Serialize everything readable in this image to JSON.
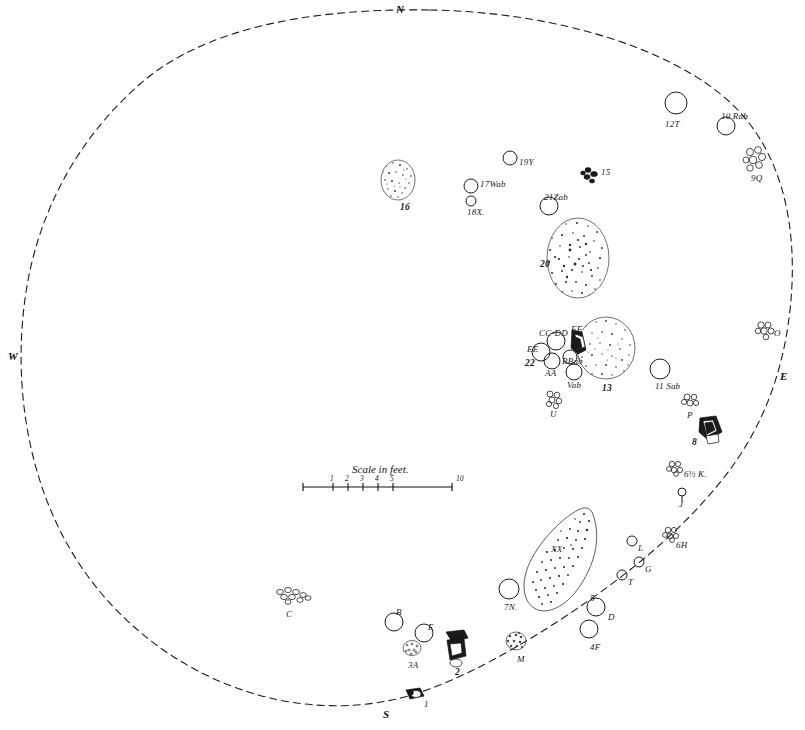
{
  "map": {
    "title": "Archaeological site plan",
    "boundary_style": "dashed",
    "ink_color": "#1a1a1a",
    "paper_color": "#ffffff"
  },
  "compass": {
    "north": "N",
    "south": "S",
    "east": "E",
    "west": "W"
  },
  "scale": {
    "caption": "Scale in feet.",
    "ticks": [
      "1",
      "2",
      "3",
      "4",
      "5",
      "10"
    ]
  },
  "features": [
    {
      "id": "f16",
      "label": "16",
      "x": 398,
      "y": 180,
      "kind": "stipple-blob",
      "w": 34,
      "h": 40,
      "lx": 400,
      "ly": 203,
      "bold": true
    },
    {
      "id": "f19y",
      "label": "19Y",
      "x": 510,
      "y": 158,
      "kind": "circle",
      "r": 7,
      "lx": 519,
      "ly": 158,
      "bold": false
    },
    {
      "id": "f17",
      "label": "17Wab",
      "x": 471,
      "y": 186,
      "kind": "circle",
      "r": 7,
      "lx": 480,
      "ly": 180,
      "bold": false
    },
    {
      "id": "f18x",
      "label": "18X.",
      "x": 471,
      "y": 201,
      "kind": "circle",
      "r": 5,
      "lx": 467,
      "ly": 208,
      "bold": false
    },
    {
      "id": "f15",
      "label": "15",
      "x": 592,
      "y": 173,
      "kind": "cobble-dark",
      "w": 16,
      "h": 14,
      "lx": 601,
      "ly": 168,
      "bold": false
    },
    {
      "id": "f21",
      "label": "21Zab",
      "x": 549,
      "y": 206,
      "kind": "circle",
      "r": 9,
      "lx": 544,
      "ly": 193,
      "bold": false
    },
    {
      "id": "f20",
      "label": "20",
      "x": 578,
      "y": 258,
      "kind": "stipple-blob",
      "w": 62,
      "h": 80,
      "lx": 540,
      "ly": 260,
      "bold": true
    },
    {
      "id": "f12t",
      "label": "12T",
      "x": 676,
      "y": 103,
      "kind": "circle",
      "r": 11,
      "lx": 665,
      "ly": 120,
      "bold": false
    },
    {
      "id": "f10",
      "label": "10 Rab",
      "x": 726,
      "y": 126,
      "kind": "circle",
      "r": 9,
      "lx": 721,
      "ly": 112,
      "bold": false
    },
    {
      "id": "f9q",
      "label": "9Q",
      "x": 755,
      "y": 158,
      "kind": "cobble-cluster",
      "w": 20,
      "h": 20,
      "lx": 751,
      "ly": 174,
      "bold": false
    },
    {
      "id": "fO",
      "label": "O",
      "x": 765,
      "y": 329,
      "kind": "cobble-cluster",
      "w": 16,
      "h": 15,
      "lx": 774,
      "ly": 329,
      "bold": false
    },
    {
      "id": "fccdd",
      "label": "CC-DD",
      "x": 556,
      "y": 341,
      "kind": "circle",
      "r": 9,
      "lx": 539,
      "ly": 329,
      "bold": false
    },
    {
      "id": "fee",
      "label": "EE",
      "x": 541,
      "y": 352,
      "kind": "circle",
      "r": 9,
      "lx": 527,
      "ly": 345,
      "bold": false
    },
    {
      "id": "f22",
      "label": "22",
      "x": 541,
      "y": 352,
      "kind": "none",
      "r": 0,
      "lx": 525,
      "ly": 359,
      "bold": true
    },
    {
      "id": "faa",
      "label": "AA",
      "x": 552,
      "y": 361,
      "kind": "circle",
      "r": 8,
      "lx": 545,
      "ly": 369,
      "bold": false
    },
    {
      "id": "fbbab",
      "label": "BBab",
      "x": 570,
      "y": 357,
      "kind": "circle",
      "r": 7,
      "lx": 562,
      "ly": 357,
      "bold": false
    },
    {
      "id": "fff",
      "label": "FF",
      "x": 577,
      "y": 340,
      "kind": "slab-dark",
      "w": 14,
      "h": 26,
      "lx": 571,
      "ly": 325,
      "bold": false
    },
    {
      "id": "fvab",
      "label": "Vab",
      "x": 574,
      "y": 372,
      "kind": "circle",
      "r": 8,
      "lx": 567,
      "ly": 381,
      "bold": false
    },
    {
      "id": "f13",
      "label": "13",
      "x": 606,
      "y": 348,
      "kind": "stipple-blob",
      "w": 58,
      "h": 62,
      "lx": 602,
      "ly": 384,
      "bold": true
    },
    {
      "id": "f11",
      "label": "11 Sab",
      "x": 660,
      "y": 369,
      "kind": "circle",
      "r": 10,
      "lx": 655,
      "ly": 382,
      "bold": false
    },
    {
      "id": "fU",
      "label": "U",
      "x": 553,
      "y": 398,
      "kind": "cobble-cluster",
      "w": 14,
      "h": 14,
      "lx": 550,
      "ly": 410,
      "bold": false
    },
    {
      "id": "fP",
      "label": "P",
      "x": 690,
      "y": 400,
      "kind": "cobble-cluster",
      "w": 14,
      "h": 13,
      "lx": 687,
      "ly": 411,
      "bold": false
    },
    {
      "id": "f8",
      "label": "8",
      "x": 707,
      "y": 428,
      "kind": "slab-dark",
      "w": 26,
      "h": 22,
      "lx": 692,
      "ly": 438,
      "bold": true
    },
    {
      "id": "f65k",
      "label": "6½ K.",
      "x": 675,
      "y": 467,
      "kind": "cobble-cluster",
      "w": 14,
      "h": 14,
      "lx": 684,
      "ly": 470,
      "bold": false
    },
    {
      "id": "fJ",
      "label": "J",
      "x": 682,
      "y": 492,
      "kind": "circle",
      "r": 4,
      "lx": 679,
      "ly": 500,
      "bold": false
    },
    {
      "id": "f6h",
      "label": "6H",
      "x": 671,
      "y": 533,
      "kind": "cobble-cluster",
      "w": 14,
      "h": 14,
      "lx": 676,
      "ly": 541,
      "bold": false
    },
    {
      "id": "fL",
      "label": "L",
      "x": 632,
      "y": 541,
      "kind": "circle",
      "r": 5,
      "lx": 638,
      "ly": 544,
      "bold": false
    },
    {
      "id": "fG",
      "label": "G",
      "x": 639,
      "y": 562,
      "kind": "circle",
      "r": 5,
      "lx": 645,
      "ly": 565,
      "bold": false
    },
    {
      "id": "fT",
      "label": "T",
      "x": 622,
      "y": 575,
      "kind": "circle",
      "r": 5,
      "lx": 628,
      "ly": 578,
      "bold": false
    },
    {
      "id": "fxx",
      "label": "XX",
      "x": 570,
      "y": 560,
      "kind": "teardrop",
      "w": 56,
      "h": 100,
      "lx": 551,
      "ly": 545,
      "bold": false
    },
    {
      "id": "f5",
      "label": "5",
      "x": 596,
      "y": 607,
      "kind": "circle",
      "r": 9,
      "lx": 590,
      "ly": 594,
      "bold": false
    },
    {
      "id": "fD",
      "label": "D",
      "x": 596,
      "y": 607,
      "kind": "none",
      "r": 0,
      "lx": 608,
      "ly": 613,
      "bold": false
    },
    {
      "id": "f4f",
      "label": "4F",
      "x": 589,
      "y": 629,
      "kind": "circle",
      "r": 9,
      "lx": 590,
      "ly": 643,
      "bold": false
    },
    {
      "id": "f7n",
      "label": "7N.",
      "x": 509,
      "y": 589,
      "kind": "circle",
      "r": 10,
      "lx": 504,
      "ly": 603,
      "bold": false
    },
    {
      "id": "fM",
      "label": "M",
      "x": 516,
      "y": 641,
      "kind": "cobble-cluster",
      "w": 20,
      "h": 18,
      "lx": 517,
      "ly": 655,
      "bold": false
    },
    {
      "id": "fB",
      "label": "B",
      "x": 394,
      "y": 622,
      "kind": "circle",
      "r": 9,
      "lx": 396,
      "ly": 608,
      "bold": false
    },
    {
      "id": "fE",
      "label": "E",
      "x": 424,
      "y": 633,
      "kind": "circle",
      "r": 9,
      "lx": 428,
      "ly": 623,
      "bold": false
    },
    {
      "id": "f3a",
      "label": "3A",
      "x": 412,
      "y": 648,
      "kind": "cobble-cluster",
      "w": 16,
      "h": 14,
      "lx": 408,
      "ly": 661,
      "bold": false
    },
    {
      "id": "f2",
      "label": "2",
      "x": 456,
      "y": 645,
      "kind": "slab-dark",
      "w": 24,
      "h": 28,
      "lx": 455,
      "ly": 668,
      "bold": true
    },
    {
      "id": "fC",
      "label": "C",
      "x": 290,
      "y": 597,
      "kind": "cobble-chain",
      "w": 30,
      "h": 16,
      "lx": 286,
      "ly": 610,
      "bold": false
    },
    {
      "id": "f1",
      "label": "1",
      "x": 415,
      "y": 695,
      "kind": "slab-dark",
      "w": 22,
      "h": 12,
      "lx": 424,
      "ly": 700,
      "bold": false
    }
  ]
}
